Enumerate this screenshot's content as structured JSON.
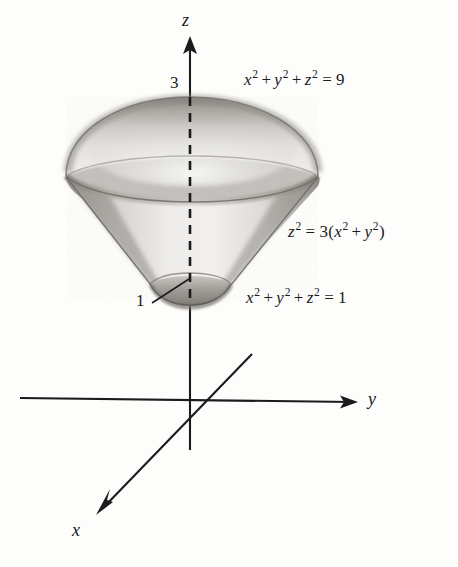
{
  "figure": {
    "type": "3d-solid-region-diagram",
    "background_color": "#fdfdfc",
    "ink_color": "#1b1b1b"
  },
  "axes": {
    "z": {
      "label": "z",
      "label_x": 186,
      "label_y": 20,
      "arrow_tip_x": 190,
      "arrow_tip_y": 42,
      "bottom_x": 190,
      "bottom_y": 448
    },
    "y": {
      "label": "y",
      "label_x": 370,
      "label_y": 390,
      "arrow_tip_x": 358,
      "arrow_tip_y": 402,
      "start_x": 20,
      "start_y": 398
    },
    "x": {
      "label": "x",
      "label_x": 74,
      "label_y": 521,
      "arrow_tip_x": 96,
      "arrow_tip_y": 513,
      "back_x": 250,
      "back_y": 355
    },
    "origin_x": 190,
    "origin_y": 402
  },
  "tick_labels": [
    {
      "text": "3",
      "x": 170,
      "y": 72,
      "meaning": "z-intercept of outer sphere"
    },
    {
      "text": "1",
      "x": 136,
      "y": 290,
      "meaning": "z-intercept of inner sphere"
    }
  ],
  "leader_line": {
    "from_x": 152,
    "from_y": 302,
    "to_x": 188,
    "to_y": 278
  },
  "equations": [
    {
      "id": "outer-sphere",
      "plain": "x^2 + y^2 + z^2 = 9",
      "x": 244,
      "y": 69,
      "terms": [
        {
          "base": "x",
          "exp": "2"
        },
        {
          "op": "+"
        },
        {
          "base": "y",
          "exp": "2"
        },
        {
          "op": "+"
        },
        {
          "base": "z",
          "exp": "2"
        },
        {
          "eq": "="
        },
        {
          "num": "9"
        }
      ]
    },
    {
      "id": "cone",
      "plain": "z^2 = 3 (x^2 + y^2)",
      "x": 288,
      "y": 221,
      "terms": [
        {
          "base": "z",
          "exp": "2"
        },
        {
          "eq": "="
        },
        {
          "num": "3"
        },
        {
          "paren": "("
        },
        {
          "base": "x",
          "exp": "2"
        },
        {
          "op": "+"
        },
        {
          "base": "y",
          "exp": "2"
        },
        {
          "paren": ")"
        }
      ]
    },
    {
      "id": "inner-sphere",
      "plain": "x^2 + y^2 + z^2 = 1",
      "x": 246,
      "y": 287,
      "terms": [
        {
          "base": "x",
          "exp": "2"
        },
        {
          "op": "+"
        },
        {
          "base": "y",
          "exp": "2"
        },
        {
          "op": "+"
        },
        {
          "base": "z",
          "exp": "2"
        },
        {
          "eq": "="
        },
        {
          "num": "1"
        }
      ]
    }
  ],
  "solid": {
    "apex_top_x": 190,
    "apex_top_y": 97,
    "outer_cap_left_x": 66,
    "outer_cap_right_x": 318,
    "rim_y": 175,
    "rim_bottom_y": 203,
    "cone_bottom_left_x": 148,
    "cone_bottom_right_x": 236,
    "cone_bottom_y": 288,
    "inner_cap_dip_y": 303,
    "shade_light": "#f2f1ef",
    "shade_mid": "#cfcdc9",
    "shade_dark": "#9a9792",
    "shade_edge": "#7c7974"
  }
}
